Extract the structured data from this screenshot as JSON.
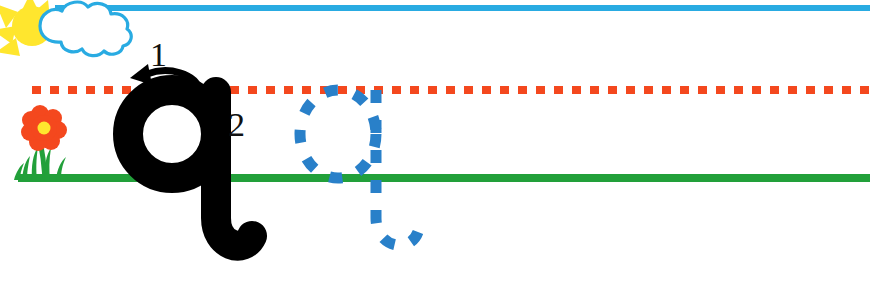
{
  "worksheet": {
    "title": "Lowercase letter q handwriting practice",
    "letter": "q",
    "width": 870,
    "height": 286
  },
  "guide_lines": {
    "sky_line": {
      "name": "sky-line",
      "color": "#29ABE2",
      "style": "solid",
      "y": 8
    },
    "mid_line": {
      "name": "midline-dashed",
      "color": "#F4481E",
      "style": "dashed",
      "y": 90
    },
    "ground_line": {
      "name": "ground-line",
      "color": "#22A03A",
      "style": "solid",
      "y": 178
    }
  },
  "decorations": {
    "sun": {
      "name": "sun-icon",
      "color": "#FFE62E"
    },
    "cloud": {
      "name": "cloud-icon",
      "fill": "#FFFFFF",
      "outline": "#29ABE2"
    },
    "flower": {
      "name": "flower-icon",
      "petal_color": "#F4481E",
      "center_color": "#FFE62E",
      "stem_color": "#22A03A"
    },
    "grass": {
      "name": "grass-icon",
      "color": "#22A03A"
    }
  },
  "model_letter": {
    "name": "model-letter-q",
    "character": "q",
    "color": "#000000"
  },
  "stroke_guides": [
    {
      "label": "1",
      "name": "stroke-arrow-1",
      "direction": "counterclockwise-curve-left",
      "color": "#000000"
    },
    {
      "label": "2",
      "name": "stroke-arrow-2",
      "direction": "down",
      "color": "#000000"
    }
  ],
  "trace_letter": {
    "name": "trace-letter-q",
    "character": "q",
    "color": "#2980C9",
    "style": "dashed"
  }
}
